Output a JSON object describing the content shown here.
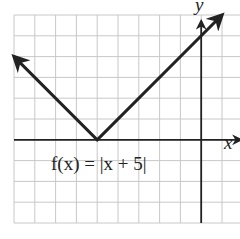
{
  "chart_data": {
    "type": "line",
    "title": "",
    "function_label": "f(x) = |x + 5|",
    "xlabel": "x",
    "ylabel": "y",
    "xlim": [
      -9,
      1
    ],
    "ylim": [
      -4,
      6
    ],
    "grid": true,
    "grid_step": 1,
    "tick_labels": false,
    "series": [
      {
        "name": "f(x) = |x + 5|",
        "points": [
          {
            "x": -9,
            "y": 4
          },
          {
            "x": -5,
            "y": 0
          },
          {
            "x": 1,
            "y": 6
          }
        ],
        "arrows_both_ends": true,
        "color": "#222222"
      }
    ],
    "vertex": {
      "x": -5,
      "y": 0
    }
  },
  "labels": {
    "x_axis": "x",
    "y_axis": "y",
    "equation": "f(x) = |x + 5|"
  },
  "colors": {
    "grid": "#c8c8c8",
    "axis": "#222222",
    "curve": "#222222"
  }
}
